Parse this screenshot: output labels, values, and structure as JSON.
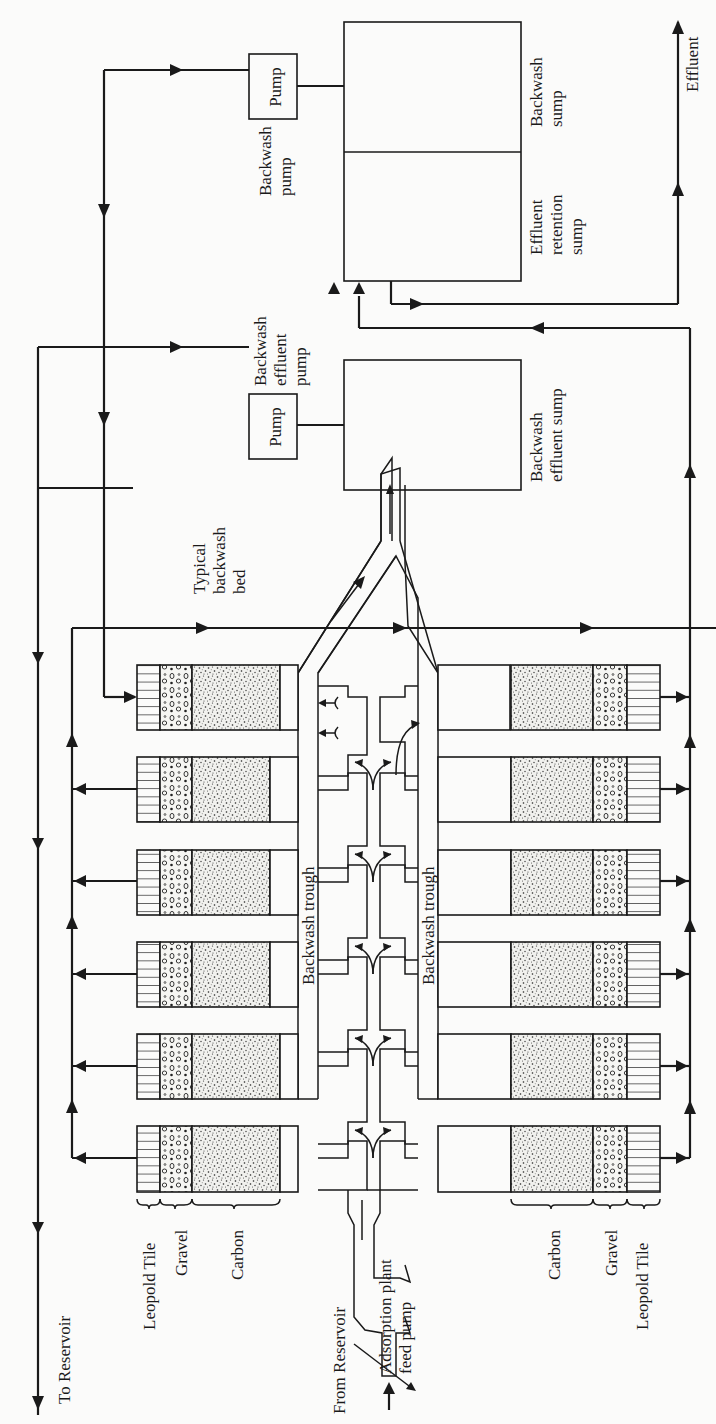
{
  "figure": {
    "orientation": "rotated 90 degrees counter-clockwise (labels read bottom-to-top)"
  },
  "labels": {
    "to_reservoir": "To Reservoir",
    "from_reservoir": "From Reservoir",
    "feed_pump_line1": "Adsorption plant",
    "feed_pump_line2": "feed pump",
    "effluent": "Effluent",
    "typical_bed_line1": "Typical",
    "typical_bed_line2": "backwash",
    "typical_bed_line3": "bed",
    "backwash_trough_left": "Backwash trough",
    "backwash_trough_right": "Backwash trough",
    "pump_top": "Pump",
    "pump_bottom": "Pump",
    "backwash_pump_line1": "Backwash",
    "backwash_pump_line2": "pump",
    "bw_effluent_pump_line1": "Backwash",
    "bw_effluent_pump_line2": "effluent",
    "bw_effluent_pump_line3": "pump",
    "backwash_sump_line1": "Backwash",
    "backwash_sump_line2": "sump",
    "effluent_retention_line1": "Effluent",
    "effluent_retention_line2": "retention",
    "effluent_retention_line3": "sump",
    "bw_effluent_sump_line1": "Backwash",
    "bw_effluent_sump_line2": "effluent sump",
    "layers_left": [
      "Leopold Tile",
      "Gravel",
      "Carbon"
    ],
    "layers_right": [
      "Carbon",
      "Gravel",
      "Leopold Tile"
    ]
  },
  "components": {
    "bed_count_per_side": 6,
    "bed_layers": [
      "Leopold Tile",
      "Gravel",
      "Carbon"
    ],
    "pumps": [
      "Backwash pump",
      "Backwash effluent pump",
      "Adsorption plant feed pump"
    ],
    "sumps": [
      "Backwash sump",
      "Effluent retention sump",
      "Backwash effluent sump"
    ]
  },
  "colors": {
    "ink": "#1a1a1a",
    "paper": "#fbfbfa"
  }
}
